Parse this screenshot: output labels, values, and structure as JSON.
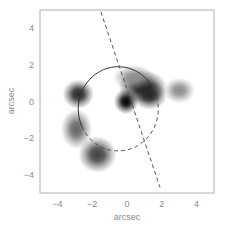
{
  "chart_data": {
    "type": "heatmap",
    "title": "",
    "xlabel": "arcsec",
    "ylabel": "arcsec",
    "xlim": [
      -5,
      5
    ],
    "ylim": [
      -5,
      5
    ],
    "xticks": [
      -4,
      -2,
      0,
      2,
      4
    ],
    "yticks": [
      -4,
      -2,
      0,
      2,
      4
    ],
    "xtick_labels": [
      "−4",
      "−2",
      "0",
      "2",
      "4"
    ],
    "ytick_labels": [
      "−4",
      "−2",
      "0",
      "2",
      "4"
    ],
    "grid": false,
    "legend": "none",
    "colormap": "grayscale (white = low, black = high)",
    "blobs": [
      {
        "name": "central-lens",
        "x": -0.05,
        "y": 0.0,
        "sx": 0.35,
        "sy": 0.35,
        "peak": 1.0
      },
      {
        "name": "arc-ne-core",
        "x": 0.9,
        "y": 0.8,
        "sx": 0.7,
        "sy": 0.45,
        "peak": 0.9
      },
      {
        "name": "arc-ne-tail",
        "x": 1.3,
        "y": 0.35,
        "sx": 0.5,
        "sy": 0.4,
        "peak": 0.85
      },
      {
        "name": "arc-ne-extended",
        "x": 0.4,
        "y": 1.3,
        "sx": 0.6,
        "sy": 0.35,
        "peak": 0.45
      },
      {
        "name": "east-knot",
        "x": 3.0,
        "y": 0.6,
        "sx": 0.45,
        "sy": 0.35,
        "peak": 0.45
      },
      {
        "name": "west-image",
        "x": -2.8,
        "y": 0.4,
        "sx": 0.45,
        "sy": 0.4,
        "peak": 0.85
      },
      {
        "name": "sw-arc-upper",
        "x": -2.9,
        "y": -1.5,
        "sx": 0.45,
        "sy": 0.55,
        "peak": 0.6
      },
      {
        "name": "sw-arc-lower",
        "x": -1.7,
        "y": -2.9,
        "sx": 0.55,
        "sy": 0.5,
        "peak": 0.75
      }
    ],
    "critical_curve": {
      "style": "solid",
      "center": [
        -0.5,
        -0.4
      ],
      "radius": 2.3,
      "arc_deg": [
        40,
        205
      ]
    },
    "caustic_curve": {
      "style": "dashed",
      "center": [
        -0.5,
        -0.4
      ],
      "radius": 2.3,
      "arc_deg": [
        205,
        380
      ]
    },
    "major_axis_line": {
      "style": "dashed",
      "from": [
        -1.5,
        4.9
      ],
      "to": [
        1.9,
        -4.7
      ]
    }
  }
}
